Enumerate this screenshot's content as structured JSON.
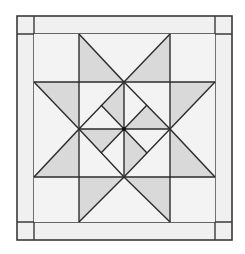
{
  "diagram": {
    "colors": {
      "background": "#ffffff",
      "fill_light": "#f0f0f0",
      "fill_shaded": "#d9d9d9",
      "line": "#2b2b2b"
    },
    "outer_frame": {
      "x": 17,
      "y": 16,
      "w": 215,
      "h": 224
    },
    "inner_frame": {
      "x": 34,
      "y": 34,
      "w": 181,
      "h": 188
    },
    "grid": {
      "xs": [
        79,
        170
      ],
      "ys": [
        82,
        177
      ]
    },
    "center": {
      "x": 124,
      "y": 129
    }
  }
}
